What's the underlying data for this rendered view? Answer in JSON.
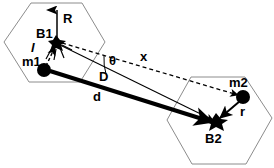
{
  "figure": {
    "background_color": "#ffffff",
    "stroke_color": "#000000",
    "cell_outline_color": "#808080",
    "width": 274,
    "height": 168
  },
  "labels": {
    "b1": "B1",
    "m1": "m1",
    "b2": "B2",
    "m2": "m2",
    "radius_R": "R",
    "length_l": "l",
    "distance_D": "D",
    "distance_d": "d",
    "distance_x": "x",
    "radius_r": "r",
    "angle_theta": "θ"
  },
  "nodes": [
    {
      "name": "B1",
      "label": "B1",
      "x": 56,
      "y": 42,
      "style": "star-marker"
    },
    {
      "name": "m1",
      "label": "m1",
      "x": 44,
      "y": 70,
      "style": "filled-circle"
    },
    {
      "name": "B2",
      "label": "B2",
      "x": 216,
      "y": 121,
      "style": "star-marker"
    },
    {
      "name": "m2",
      "label": "m2",
      "x": 243,
      "y": 97,
      "style": "filled-circle"
    }
  ],
  "edges": [
    {
      "name": "R-arrow",
      "label": "R",
      "from": "B1",
      "to": "cell1-top-edge",
      "style": "solid-thin-arrow"
    },
    {
      "name": "l-segment",
      "label": "l",
      "from": "m1",
      "to": "B1",
      "style": "dashed-arrow"
    },
    {
      "name": "d-vector",
      "label": "d",
      "from": "m1",
      "to": "B2",
      "style": "solid-thick-arrow"
    },
    {
      "name": "D-vector",
      "label": "D",
      "from": "B1",
      "to": "B2",
      "style": "solid-thin-arrow"
    },
    {
      "name": "x-vector",
      "label": "x",
      "from": "B1",
      "to": "m2",
      "style": "dashed-arrow"
    },
    {
      "name": "r-segment",
      "label": "r",
      "from": "m2",
      "to": "B2",
      "style": "solid-thin-arrow"
    }
  ],
  "angles": [
    {
      "name": "theta",
      "label": "θ",
      "vertex": "B1",
      "between": [
        "D-vector",
        "x-vector"
      ]
    }
  ],
  "cells": [
    {
      "name": "cell-1",
      "shape": "hexagon",
      "center_node": "B1"
    },
    {
      "name": "cell-2",
      "shape": "hexagon",
      "center_node": "B2"
    }
  ]
}
